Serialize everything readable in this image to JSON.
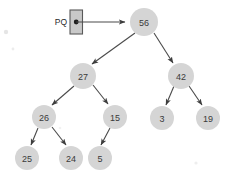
{
  "diagram": {
    "background_color": "#ffffff",
    "node_fill_color": "#d5d5d5",
    "node_text_color": "#3a3a3a",
    "edge_color": "#4a4a4a",
    "pointer": {
      "label": "PQ",
      "box_fill_color": "#c9c9c9",
      "box_border_color": "#5a5a5a",
      "dot_color": "#1d1d1d",
      "target_node": "56"
    },
    "nodes": [
      {
        "id": "n56",
        "label": "56",
        "cx": 144,
        "cy": 22,
        "r": 14
      },
      {
        "id": "n27",
        "label": "27",
        "cx": 83,
        "cy": 76,
        "r": 13
      },
      {
        "id": "n42",
        "label": "42",
        "cx": 181,
        "cy": 76,
        "r": 13
      },
      {
        "id": "n26",
        "label": "26",
        "cx": 44,
        "cy": 117,
        "r": 12
      },
      {
        "id": "n15",
        "label": "15",
        "cx": 115,
        "cy": 117,
        "r": 12
      },
      {
        "id": "n3",
        "label": "3",
        "cx": 162,
        "cy": 118,
        "r": 12
      },
      {
        "id": "n19",
        "label": "19",
        "cx": 208,
        "cy": 118,
        "r": 12
      },
      {
        "id": "n25",
        "label": "25",
        "cx": 27,
        "cy": 158,
        "r": 12
      },
      {
        "id": "n24",
        "label": "24",
        "cx": 71,
        "cy": 158,
        "r": 12
      },
      {
        "id": "n5",
        "label": "5",
        "cx": 100,
        "cy": 158,
        "r": 12
      }
    ],
    "edges": [
      {
        "from": "n56",
        "to": "n27"
      },
      {
        "from": "n56",
        "to": "n42"
      },
      {
        "from": "n27",
        "to": "n26"
      },
      {
        "from": "n27",
        "to": "n15"
      },
      {
        "from": "n42",
        "to": "n3"
      },
      {
        "from": "n42",
        "to": "n19"
      },
      {
        "from": "n26",
        "to": "n25"
      },
      {
        "from": "n26",
        "to": "n24"
      },
      {
        "from": "n15",
        "to": "n5"
      }
    ]
  }
}
